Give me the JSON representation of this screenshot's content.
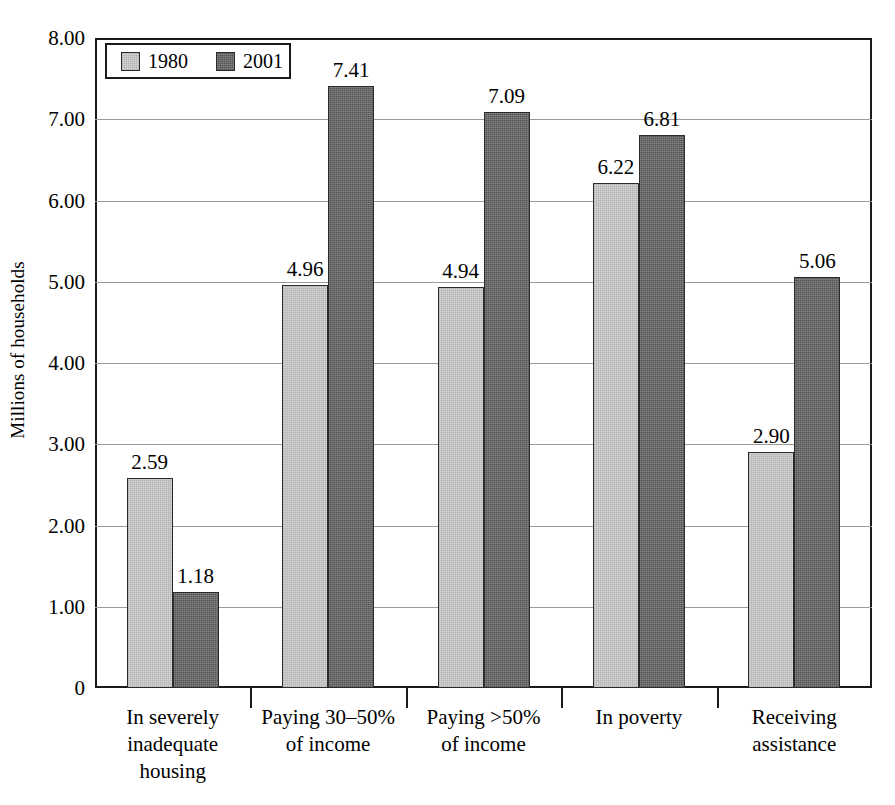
{
  "chart_data": {
    "type": "bar",
    "title": "",
    "xlabel": "",
    "ylabel": "Millions of households",
    "ylim": [
      0,
      8
    ],
    "ytick_labels": [
      "8.00",
      "7.00",
      "6.00",
      "5.00",
      "4.00",
      "3.00",
      "2.00",
      "1.00",
      "0"
    ],
    "ytick_values": [
      8,
      7,
      6,
      5,
      4,
      3,
      2,
      1,
      0
    ],
    "grid": true,
    "legend_position": "top-left",
    "categories": [
      "In severely\ninadequate\nhousing",
      "Paying 30–50%\nof income",
      "Paying >50%\nof income",
      "In poverty",
      "Receiving\nassistance"
    ],
    "series": [
      {
        "name": "1980",
        "color": "#d6d6d6",
        "values": [
          2.59,
          4.96,
          4.94,
          6.22,
          2.9
        ],
        "value_labels": [
          "2.59",
          "4.96",
          "4.94",
          "6.22",
          "2.90"
        ]
      },
      {
        "name": "2001",
        "color": "#6e6e6e",
        "values": [
          1.18,
          7.41,
          7.09,
          6.81,
          5.06
        ],
        "value_labels": [
          "1.18",
          "7.41",
          "7.09",
          "6.81",
          "5.06"
        ]
      }
    ]
  },
  "legend": {
    "items": [
      {
        "label": "1980",
        "swatch": "light"
      },
      {
        "label": "2001",
        "swatch": "dark"
      }
    ]
  }
}
